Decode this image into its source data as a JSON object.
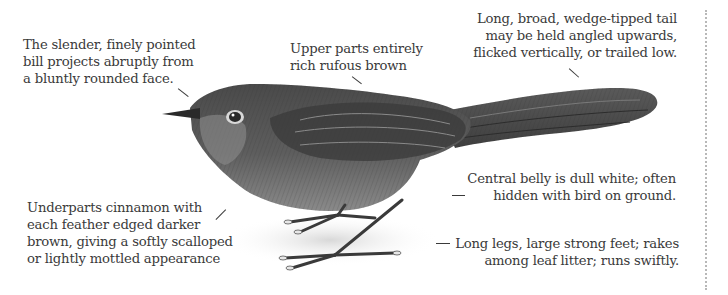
{
  "figure": {
    "subject": "bird",
    "annotations": {
      "bill": {
        "lines": [
          "The slender, finely pointed",
          "bill projects abruptly from",
          "a bluntly rounded face."
        ]
      },
      "upperparts": {
        "lines": [
          "Upper parts entirely",
          "rich rufous brown"
        ]
      },
      "tail": {
        "lines": [
          "Long, broad, wedge-tipped tail",
          "may be held angled upwards,",
          "flicked vertically, or trailed low."
        ]
      },
      "underparts": {
        "lines": [
          "Underparts cinnamon with",
          "each feather edged darker",
          "brown, giving a softly scalloped",
          "or lightly mottled appearance"
        ]
      },
      "belly": {
        "lines": [
          "Central belly is dull white; often",
          "hidden with bird on ground."
        ]
      },
      "legs": {
        "lines": [
          "Long legs, large strong feet; rakes",
          "among leaf litter; runs swiftly."
        ]
      }
    },
    "colors": {
      "text": "#3a3a3a",
      "bird_dark": "#3c3c3c",
      "bird_mid": "#6e6e6e",
      "bird_light": "#a8a8a8",
      "divider": "#b8b8b8"
    }
  }
}
